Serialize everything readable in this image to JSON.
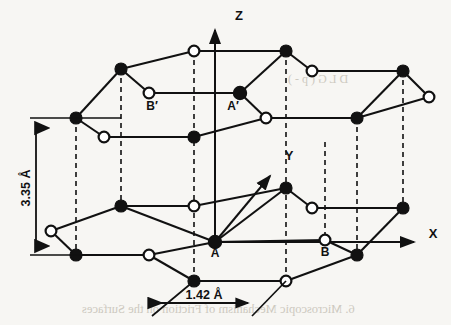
{
  "figure": {
    "background_color": "#f7f6f3",
    "ink_color": "#111111"
  },
  "axes": [
    {
      "name": "z-axis",
      "label": "Z",
      "label_x": 239,
      "label_y": 18,
      "x1": 215,
      "y1": 242,
      "x2": 215,
      "y2": 26
    },
    {
      "name": "x-axis",
      "label": "X",
      "label_x": 432,
      "label_y": 236,
      "x1": 215,
      "y1": 242,
      "x2": 418,
      "y2": 242
    },
    {
      "name": "y-axis",
      "label": "Y",
      "label_x": 288,
      "label_y": 156,
      "x1": 215,
      "y1": 242,
      "x2": 272,
      "y2": 172
    }
  ],
  "dimensions": [
    {
      "name": "interlayer-spacing",
      "label": "3.35 Å",
      "orientation": "vertical",
      "label_x": 30,
      "label_y": 188,
      "x": 36,
      "y_top": 118,
      "y_bottom": 255
    },
    {
      "name": "bond-length",
      "label": "1.42 Å",
      "orientation": "horizontal",
      "label_x": 196,
      "label_y": 297,
      "y": 303,
      "x_left": 156,
      "x_right": 252
    }
  ],
  "atom_labels": [
    {
      "name": "atom-label-a-prime",
      "text": "A′",
      "x": 229,
      "y": 105,
      "site": "A",
      "layer": "upper",
      "type": "filled"
    },
    {
      "name": "atom-label-b-prime",
      "text": "B′",
      "x": 155,
      "y": 106,
      "site": "B",
      "layer": "upper",
      "type": "open"
    },
    {
      "name": "atom-label-a",
      "text": "A",
      "x": 231,
      "y": 253,
      "site": "A",
      "layer": "lower",
      "type": "filled"
    },
    {
      "name": "atom-label-b",
      "text": "B",
      "x": 325,
      "y": 253,
      "site": "B",
      "layer": "lower",
      "type": "open"
    }
  ],
  "legend_notes": {
    "filled_circle_meaning": "A-site carbon atom",
    "open_circle_meaning": "B-site carbon atom",
    "dashed_line_meaning": "vertical registry between stacked layers"
  },
  "layers": [
    {
      "name": "upper-layer",
      "atoms": [
        {
          "id": "u1",
          "x": 121,
          "y": 69,
          "type": "filled"
        },
        {
          "id": "u2",
          "x": 194,
          "y": 51,
          "type": "open"
        },
        {
          "id": "u3",
          "x": 286,
          "y": 51,
          "type": "filled"
        },
        {
          "id": "u4",
          "x": 312,
          "y": 71,
          "type": "open"
        },
        {
          "id": "u5",
          "x": 403,
          "y": 71,
          "type": "filled"
        },
        {
          "id": "u6",
          "x": 429,
          "y": 97,
          "type": "open"
        },
        {
          "id": "u7",
          "x": 149,
          "y": 93,
          "type": "open"
        },
        {
          "id": "u8",
          "x": 240,
          "y": 93,
          "type": "filled"
        },
        {
          "id": "u9",
          "x": 266,
          "y": 118,
          "type": "open"
        },
        {
          "id": "u10",
          "x": 357,
          "y": 118,
          "type": "filled"
        },
        {
          "id": "u11",
          "x": 76,
          "y": 118,
          "type": "filled"
        },
        {
          "id": "u12",
          "x": 104,
          "y": 137,
          "type": "open"
        },
        {
          "id": "u13",
          "x": 194,
          "y": 137,
          "type": "filled"
        }
      ],
      "bonds": [
        [
          "u1",
          "u2"
        ],
        [
          "u2",
          "u3"
        ],
        [
          "u3",
          "u4"
        ],
        [
          "u4",
          "u5"
        ],
        [
          "u5",
          "u6"
        ],
        [
          "u1",
          "u7"
        ],
        [
          "u7",
          "u8"
        ],
        [
          "u8",
          "u3"
        ],
        [
          "u8",
          "u9"
        ],
        [
          "u9",
          "u10"
        ],
        [
          "u10",
          "u5"
        ],
        [
          "u11",
          "u1"
        ],
        [
          "u11",
          "u12"
        ],
        [
          "u12",
          "u13"
        ],
        [
          "u13",
          "u9"
        ],
        [
          "u10",
          "u6"
        ]
      ]
    },
    {
      "name": "lower-layer",
      "atoms": [
        {
          "id": "l1",
          "x": 121,
          "y": 206,
          "type": "filled"
        },
        {
          "id": "l2",
          "x": 194,
          "y": 206,
          "type": "open"
        },
        {
          "id": "l3",
          "x": 286,
          "y": 188,
          "type": "filled"
        },
        {
          "id": "l4",
          "x": 312,
          "y": 208,
          "type": "open"
        },
        {
          "id": "l5",
          "x": 403,
          "y": 208,
          "type": "filled"
        },
        {
          "id": "l6",
          "x": 51,
          "y": 231,
          "type": "open"
        },
        {
          "id": "l7",
          "x": 215,
          "y": 242,
          "type": "filled"
        },
        {
          "id": "l8",
          "x": 325,
          "y": 240,
          "type": "open"
        },
        {
          "id": "l9",
          "x": 76,
          "y": 255,
          "type": "filled"
        },
        {
          "id": "l10",
          "x": 149,
          "y": 255,
          "type": "open"
        },
        {
          "id": "l11",
          "x": 357,
          "y": 255,
          "type": "filled"
        },
        {
          "id": "l12",
          "x": 194,
          "y": 281,
          "type": "filled"
        },
        {
          "id": "l13",
          "x": 286,
          "y": 281,
          "type": "open"
        }
      ],
      "bonds": [
        [
          "l1",
          "l2"
        ],
        [
          "l2",
          "l3"
        ],
        [
          "l3",
          "l4"
        ],
        [
          "l4",
          "l5"
        ],
        [
          "l6",
          "l1"
        ],
        [
          "l6",
          "l9"
        ],
        [
          "l9",
          "l10"
        ],
        [
          "l10",
          "l7"
        ],
        [
          "l7",
          "l3"
        ],
        [
          "l7",
          "l8"
        ],
        [
          "l8",
          "l11"
        ],
        [
          "l11",
          "l5"
        ],
        [
          "l10",
          "l12"
        ],
        [
          "l12",
          "l13"
        ],
        [
          "l13",
          "l11"
        ],
        [
          "l8",
          "l11"
        ]
      ]
    }
  ],
  "stacking_lines": [
    {
      "name": "registry-line-1",
      "x": 121,
      "y1": 69,
      "y2": 206
    },
    {
      "name": "registry-line-2",
      "x": 194,
      "y1": 51,
      "y2": 281
    },
    {
      "name": "registry-line-3",
      "x": 286,
      "y1": 51,
      "y2": 281
    },
    {
      "name": "registry-line-4",
      "x": 357,
      "y1": 118,
      "y2": 255
    },
    {
      "name": "registry-line-5",
      "x": 403,
      "y1": 71,
      "y2": 208
    },
    {
      "name": "registry-line-6",
      "x": 76,
      "y1": 118,
      "y2": 255
    },
    {
      "name": "registry-line-7",
      "x": 325,
      "y1": 142,
      "y2": 240
    }
  ],
  "bleed_through": [
    {
      "name": "bleed-text-lower",
      "text": "6. Microscopic Mechanism of Friction on the Surfaces",
      "x": 82,
      "y": 305
    },
    {
      "name": "bleed-text-upper",
      "text": "D  L  G  (  p  -  )",
      "x": 288,
      "y": 72
    }
  ]
}
